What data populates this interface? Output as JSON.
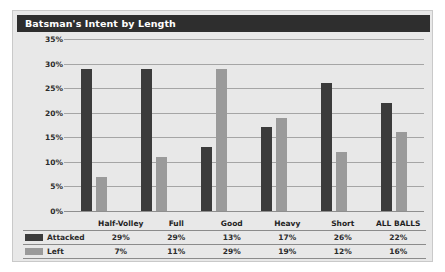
{
  "widget": {
    "title": "Batsman's Intent by Length"
  },
  "chart_data": {
    "type": "bar",
    "title": "Batsman's Intent by Length",
    "xlabel": "",
    "ylabel": "",
    "ylim": [
      0,
      35
    ],
    "ytick_labels": [
      "35%",
      "30%",
      "25%",
      "20%",
      "15%",
      "10%",
      "5%",
      "0%"
    ],
    "ytick_values": [
      35,
      30,
      25,
      20,
      15,
      10,
      5,
      0
    ],
    "grid": true,
    "legend_position": "bottom-table",
    "categories": [
      "Half-Volley",
      "Full",
      "Good",
      "Heavy",
      "Short",
      "ALL BALLS"
    ],
    "series": [
      {
        "name": "Attacked",
        "color": "#3b3b3b",
        "values": [
          29,
          29,
          13,
          17,
          26,
          22
        ],
        "labels": [
          "29%",
          "29%",
          "13%",
          "17%",
          "26%",
          "22%"
        ]
      },
      {
        "name": "Left",
        "color": "#9a9a9a",
        "values": [
          7,
          11,
          29,
          19,
          12,
          16
        ],
        "labels": [
          "7%",
          "11%",
          "29%",
          "19%",
          "12%",
          "16%"
        ]
      }
    ]
  },
  "colors": {
    "panel_background": "#e8e8e8",
    "title_bar": "#2e2e2e",
    "title_text": "#ffffff",
    "gridline": "#a5a5a5",
    "attacked": "#3b3b3b",
    "left": "#9a9a9a"
  }
}
